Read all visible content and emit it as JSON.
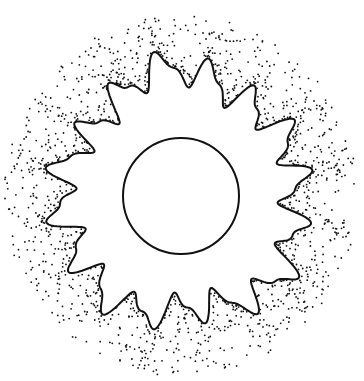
{
  "figure": {
    "colors": {
      "background": "#ffffff",
      "ink": "#111111"
    },
    "center": {
      "x": 181,
      "y": 196
    },
    "inner_circle": {
      "radius": 58,
      "stroke_width": 2
    },
    "boundary": {
      "mean_radius": 118,
      "lobes": 16,
      "stroke_width": 2
    },
    "halo": {
      "outer_radius": 175,
      "dot_count": 1400,
      "dot_radius": 0.9
    }
  }
}
